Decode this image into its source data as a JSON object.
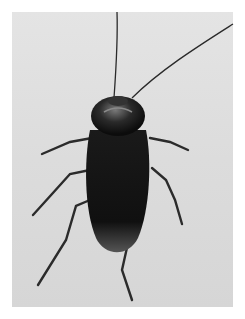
{
  "image": {
    "subject": "cockroach",
    "view": "dorsal, top-down",
    "background": "light gray",
    "colors": {
      "background": "#dddddd",
      "body": "#141414",
      "highlight": "#6e6e6e"
    }
  }
}
